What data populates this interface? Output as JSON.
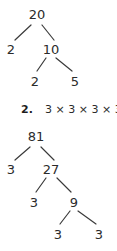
{
  "page": {
    "background_color": "#ffffff",
    "ink_color": "#2b2b2b"
  },
  "factor_tree_1": {
    "name": "factor-tree-20",
    "root_value": "20",
    "nodes": [
      {
        "id": "n20",
        "label": "20",
        "x": 37,
        "y": 8
      },
      {
        "id": "n2a",
        "label": "2",
        "x": 11,
        "y": 43
      },
      {
        "id": "n10",
        "label": "10",
        "x": 51,
        "y": 43
      },
      {
        "id": "n2b",
        "label": "2",
        "x": 35,
        "y": 75
      },
      {
        "id": "n5",
        "label": "5",
        "x": 75,
        "y": 75
      }
    ],
    "edges": [
      {
        "from": "n20",
        "to": "n2a",
        "x1": 31,
        "y1": 25,
        "x2": 15,
        "y2": 40
      },
      {
        "from": "n20",
        "to": "n10",
        "x1": 42,
        "y1": 25,
        "x2": 54,
        "y2": 40
      },
      {
        "from": "n10",
        "to": "n2b",
        "x1": 46,
        "y1": 58,
        "x2": 37,
        "y2": 71
      },
      {
        "from": "n10",
        "to": "n5",
        "x1": 56,
        "y1": 58,
        "x2": 72,
        "y2": 71
      }
    ]
  },
  "answer_line": {
    "number": "2.",
    "expression": "3 × 3 × 3 × 3"
  },
  "factor_tree_2": {
    "name": "factor-tree-81",
    "root_value": "81",
    "nodes": [
      {
        "id": "m81",
        "label": "81",
        "x": 36,
        "y": 5
      },
      {
        "id": "m3a",
        "label": "3",
        "x": 11,
        "y": 38
      },
      {
        "id": "m27",
        "label": "27",
        "x": 51,
        "y": 38
      },
      {
        "id": "m3b",
        "label": "3",
        "x": 34,
        "y": 71
      },
      {
        "id": "m9",
        "label": "9",
        "x": 74,
        "y": 71
      },
      {
        "id": "m3c",
        "label": "3",
        "x": 58,
        "y": 103
      },
      {
        "id": "m3d",
        "label": "3",
        "x": 99,
        "y": 103
      }
    ],
    "edges": [
      {
        "from": "m81",
        "to": "m3a",
        "x1": 30,
        "y1": 22,
        "x2": 15,
        "y2": 35
      },
      {
        "from": "m81",
        "to": "m27",
        "x1": 41,
        "y1": 22,
        "x2": 54,
        "y2": 35
      },
      {
        "from": "m27",
        "to": "m3b",
        "x1": 46,
        "y1": 53,
        "x2": 36,
        "y2": 67
      },
      {
        "from": "m27",
        "to": "m9",
        "x1": 57,
        "y1": 53,
        "x2": 71,
        "y2": 67
      },
      {
        "from": "m9",
        "to": "m3c",
        "x1": 70,
        "y1": 86,
        "x2": 60,
        "y2": 99
      },
      {
        "from": "m9",
        "to": "m3d",
        "x1": 78,
        "y1": 86,
        "x2": 96,
        "y2": 99
      }
    ]
  }
}
